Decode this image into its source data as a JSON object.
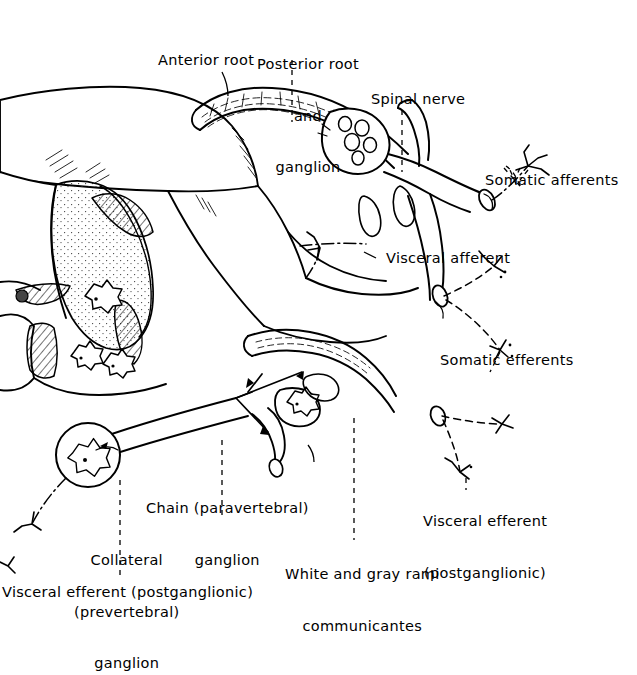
{
  "figure": {
    "background_color": "#ffffff",
    "ink_color": "#000000",
    "width": 637,
    "height": 616
  },
  "labels": {
    "anterior_root": "Anterior root",
    "posterior_root_line1": "Posterior root",
    "posterior_root_line2": "and",
    "posterior_root_line3": "ganglion",
    "spinal_nerve": "Spinal nerve",
    "somatic_afferents": "Somatic afferents",
    "visceral_afferent": "Visceral afferent",
    "somatic_efferents": "Somatic efferents",
    "chain_ganglion_line1": "Chain (paravertebral)",
    "chain_ganglion_line2": "ganglion",
    "visceral_efferent_right_line1": "Visceral efferent",
    "visceral_efferent_right_line2": "(postganglionic)",
    "white_gray_line1": "White and gray rami",
    "white_gray_line2": "communicantes",
    "collateral_line1": "Collateral",
    "collateral_line2": "(prevertebral)",
    "collateral_line3": "ganglion",
    "visceral_efferent_bottom": "Visceral efferent (postganglionic)"
  },
  "structures": {
    "spinal_cord": "spinal-cord-body",
    "gray_matter": "gray-matter-horn",
    "dorsal_root_ganglion": "dorsal-root-ganglion",
    "ganglion_cells": "ganglion-cell-bodies",
    "chain_ganglion": "sympathetic-chain-ganglion",
    "collateral_ganglion": "collateral-prevertebral-ganglion",
    "nerve_endings": "free-nerve-endings",
    "neuron_somata": "star-shaped-neuron-cell-bodies"
  }
}
